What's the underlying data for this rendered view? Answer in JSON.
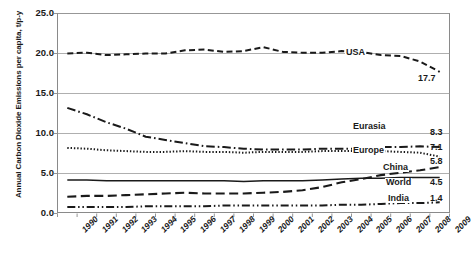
{
  "chart_data": {
    "type": "line",
    "title": "",
    "xlabel": "",
    "ylabel": "Annual Carbon Dioxide Emissions per capita,  t/p-y",
    "ylim": [
      0.0,
      25.0
    ],
    "yticks": [
      "0.0",
      "5.0",
      "10.0",
      "15.0",
      "20.0",
      "25.0"
    ],
    "ytick_values": [
      0.0,
      5.0,
      10.0,
      15.0,
      20.0,
      25.0
    ],
    "grid": true,
    "legend_position": "inline-right",
    "x": [
      1990,
      1991,
      1992,
      1993,
      1994,
      1995,
      1996,
      1997,
      1998,
      1999,
      2000,
      2001,
      2002,
      2003,
      2004,
      2005,
      2006,
      2007,
      2008,
      2009
    ],
    "categories": [
      "1990",
      "1991",
      "1992",
      "1993",
      "1994",
      "1995",
      "1996",
      "1997",
      "1998",
      "1999",
      "2000",
      "2001",
      "2002",
      "2003",
      "2004",
      "2005",
      "2006",
      "2007",
      "2008",
      "2009"
    ],
    "series": [
      {
        "name": "USA",
        "style": "dashed",
        "end_value": "17.7",
        "label": "USA",
        "values": [
          20.0,
          20.1,
          19.8,
          19.9,
          20.0,
          20.0,
          20.4,
          20.5,
          20.2,
          20.3,
          20.8,
          20.2,
          20.1,
          20.1,
          20.3,
          20.2,
          19.8,
          19.7,
          19.0,
          17.7
        ]
      },
      {
        "name": "Eurasia",
        "style": "dash-dot",
        "end_value": "8.3",
        "label": "Eurasia",
        "values": [
          13.2,
          12.4,
          11.4,
          10.6,
          9.6,
          9.2,
          8.8,
          8.4,
          8.3,
          8.1,
          8.0,
          8.0,
          8.0,
          8.1,
          8.1,
          8.1,
          8.3,
          8.3,
          8.4,
          8.3
        ]
      },
      {
        "name": "Europe",
        "style": "dotted",
        "end_value": "7.1",
        "label": "Europe",
        "values": [
          8.2,
          8.1,
          7.9,
          7.8,
          7.7,
          7.7,
          7.8,
          7.7,
          7.7,
          7.6,
          7.7,
          7.7,
          7.7,
          7.8,
          7.8,
          7.8,
          7.8,
          7.7,
          7.6,
          7.1
        ]
      },
      {
        "name": "China",
        "style": "long-dash",
        "end_value": "5.8",
        "label": "China",
        "values": [
          2.1,
          2.2,
          2.2,
          2.3,
          2.4,
          2.5,
          2.6,
          2.5,
          2.5,
          2.5,
          2.6,
          2.7,
          2.9,
          3.3,
          3.9,
          4.3,
          4.8,
          5.1,
          5.4,
          5.8
        ]
      },
      {
        "name": "World",
        "style": "solid",
        "end_value": "4.5",
        "label": "World",
        "values": [
          4.2,
          4.2,
          4.1,
          4.1,
          4.1,
          4.1,
          4.1,
          4.1,
          4.1,
          4.0,
          4.1,
          4.1,
          4.1,
          4.2,
          4.3,
          4.4,
          4.4,
          4.5,
          4.5,
          4.5
        ]
      },
      {
        "name": "India",
        "style": "dash-dot-dot",
        "end_value": "1.4",
        "label": "India",
        "values": [
          0.8,
          0.8,
          0.8,
          0.8,
          0.9,
          0.9,
          0.9,
          0.9,
          1.0,
          1.0,
          1.0,
          1.0,
          1.0,
          1.0,
          1.1,
          1.1,
          1.2,
          1.3,
          1.3,
          1.4
        ]
      }
    ],
    "colors": {
      "axis": "#8a8a8a",
      "grid": "#9a9a9a",
      "line": "#1a1a1a",
      "text": "#1a1a1a",
      "background": "#ffffff"
    }
  }
}
